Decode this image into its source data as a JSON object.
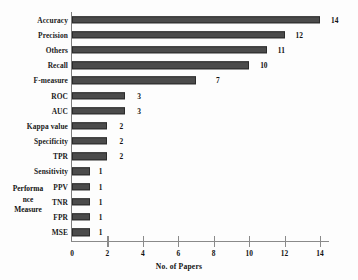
{
  "chart_data": {
    "type": "bar",
    "orientation": "horizontal",
    "title": "",
    "xlabel": "No. of Papers",
    "ylabel": "Performance Measure",
    "ylabel_wrapped": [
      "Performa",
      "nce",
      "Measure"
    ],
    "categories": [
      "Accuracy",
      "Precision",
      "Others",
      "Recall",
      "F-measure",
      "ROC",
      "AUC",
      "Kappa value",
      "Specificity",
      "TPR",
      "Sensitivity",
      "PPV",
      "TNR",
      "FPR",
      "MSE"
    ],
    "values": [
      14,
      12,
      11,
      10,
      7,
      3,
      3,
      2,
      2,
      2,
      1,
      1,
      1,
      1,
      1
    ],
    "data_labels": [
      "14",
      "12",
      "11",
      "10",
      "7",
      "3",
      "3",
      "2",
      "2",
      "2",
      "1",
      "1",
      "1",
      "1",
      "1"
    ],
    "xlim": [
      0,
      14.6
    ],
    "xticks": [
      0,
      2,
      4,
      6,
      8,
      10,
      12,
      14
    ],
    "xtick_labels": [
      "0",
      "2",
      "4",
      "6",
      "8",
      "10",
      "12",
      "14"
    ],
    "grid": false,
    "legend": false,
    "bar_color": "#4b4b4b",
    "bar_edge_color": "#2b2b2b",
    "axis_color": "#8a8a8a",
    "background_color": "#fdfdfd",
    "text_color": "#111111"
  }
}
